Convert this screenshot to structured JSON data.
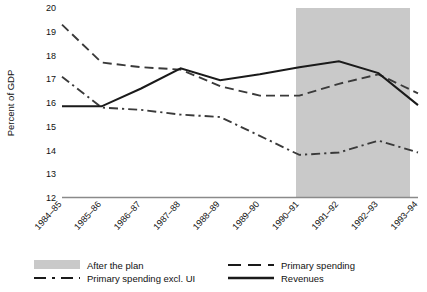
{
  "chart_data": {
    "type": "line",
    "title": "",
    "xlabel": "",
    "ylabel": "Percent of GDP",
    "ylim": [
      12,
      20
    ],
    "ytick_step": 1,
    "yticks": [
      "20",
      "19",
      "18",
      "17",
      "16",
      "15",
      "14",
      "13",
      "12"
    ],
    "grid": false,
    "legend_position": "bottom",
    "categories": [
      "1984–85",
      "1985–86",
      "1986–87",
      "1987–88",
      "1988–89",
      "1989–90",
      "1990–91",
      "1991–92",
      "1992–93",
      "1993–94"
    ],
    "series": [
      {
        "name": "Primary spending",
        "style": "dashed",
        "color": "#3a3a3a",
        "values": [
          19.3,
          17.7,
          17.5,
          17.4,
          16.7,
          16.3,
          16.3,
          16.8,
          17.2,
          16.4
        ]
      },
      {
        "name": "Primary spending excl. UI",
        "style": "dash-dot",
        "color": "#3a3a3a",
        "values": [
          17.1,
          15.8,
          15.7,
          15.5,
          15.4,
          14.6,
          13.8,
          13.9,
          14.4,
          13.9
        ]
      },
      {
        "name": "Revenues",
        "style": "solid",
        "color": "#1a1a1a",
        "values": [
          15.85,
          15.85,
          16.6,
          17.45,
          16.95,
          17.2,
          17.5,
          17.75,
          17.25,
          15.9
        ]
      }
    ],
    "shaded_region": {
      "label": "After the plan",
      "color": "#c9c9c9",
      "start_category": "1990–91",
      "end_category": "1993–94"
    },
    "annotations": []
  },
  "legend": {
    "items": [
      {
        "label": "After the plan",
        "marker": "swatch"
      },
      {
        "label": "Primary spending",
        "marker": "dashed-line"
      },
      {
        "label": "Primary spending excl. UI",
        "marker": "dash-dot-line"
      },
      {
        "label": "Revenues",
        "marker": "solid-line"
      }
    ]
  }
}
